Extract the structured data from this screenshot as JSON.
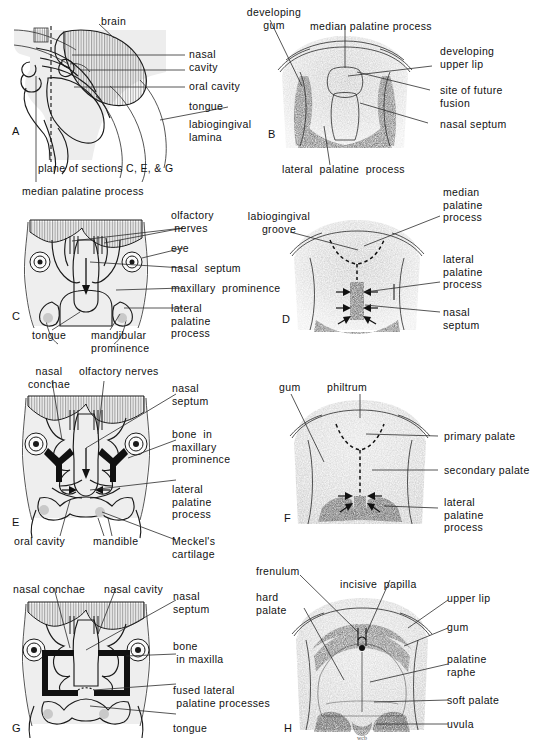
{
  "figure": {
    "panels": [
      {
        "id": "A",
        "id_label": "A",
        "view": "midsagittal section of embryonic head",
        "labels": [
          {
            "name": "brain",
            "text": "brain"
          },
          {
            "name": "nasal-cavity",
            "text": "nasal\ncavity"
          },
          {
            "name": "oral-cavity",
            "text": "oral cavity"
          },
          {
            "name": "tongue",
            "text": "tongue"
          },
          {
            "name": "labiogingival-lamina",
            "text": "labiogingival\nlamina"
          },
          {
            "name": "plane-of-sections",
            "text": "plane of sections C, E, & G"
          }
        ]
      },
      {
        "id": "B",
        "id_label": "B",
        "view": "inferior view of developing palate, earliest stage",
        "labels": [
          {
            "name": "developing-gum",
            "text": "developing\ngum"
          },
          {
            "name": "median-palatine-process",
            "text": "median palatine process"
          },
          {
            "name": "developing-upper-lip",
            "text": "developing\nupper lip"
          },
          {
            "name": "site-of-future-fusion",
            "text": "site of future\nfusion"
          },
          {
            "name": "nasal-septum",
            "text": "nasal septum"
          },
          {
            "name": "lateral-palatine-process",
            "text": "lateral  palatine  process"
          }
        ]
      },
      {
        "id": "C",
        "id_label": "C",
        "view": "coronal section, early stage",
        "labels": [
          {
            "name": "median-palatine-process",
            "text": "median palatine process"
          },
          {
            "name": "olfactory-nerves",
            "text": "olfactory\n nerves"
          },
          {
            "name": "eye",
            "text": "eye"
          },
          {
            "name": "nasal-septum",
            "text": "nasal  septum"
          },
          {
            "name": "maxillary-prominence",
            "text": "maxillary  prominence"
          },
          {
            "name": "lateral-palatine-process",
            "text": "lateral\npalatine\nprocess"
          },
          {
            "name": "tongue",
            "text": "tongue"
          },
          {
            "name": "mandibular-prominence",
            "text": "mandibular\nprominence"
          }
        ]
      },
      {
        "id": "D",
        "id_label": "D",
        "view": "inferior view of palate, fusion beginning",
        "labels": [
          {
            "name": "labiogingival-groove",
            "text": "labiogingival\ngroove"
          },
          {
            "name": "median-palatine-process",
            "text": "median\npalatine\nprocess"
          },
          {
            "name": "lateral-palatine-process",
            "text": "lateral\npalatine\nprocess"
          },
          {
            "name": "nasal-septum",
            "text": "nasal\nseptum"
          }
        ]
      },
      {
        "id": "E",
        "id_label": "E",
        "view": "coronal section, palatine processes elevating",
        "labels": [
          {
            "name": "nasal-conchae",
            "text": "nasal\nconchae"
          },
          {
            "name": "olfactory-nerves",
            "text": "olfactory nerves"
          },
          {
            "name": "nasal-septum",
            "text": "nasal\nseptum"
          },
          {
            "name": "bone-in-maxillary-prominence",
            "text": "bone  in\nmaxillary\nprominence"
          },
          {
            "name": "lateral-palatine-process",
            "text": "lateral\npalatine\nprocess"
          },
          {
            "name": "oral-cavity",
            "text": "oral cavity"
          },
          {
            "name": "mandible",
            "text": "mandible"
          },
          {
            "name": "meckels-cartilage",
            "text": "Meckel's\ncartilage"
          }
        ]
      },
      {
        "id": "F",
        "id_label": "F",
        "view": "inferior view of palate, fusion advancing",
        "labels": [
          {
            "name": "gum",
            "text": "gum"
          },
          {
            "name": "philtrum",
            "text": "philtrum"
          },
          {
            "name": "primary-palate",
            "text": "primary palate"
          },
          {
            "name": "secondary-palate",
            "text": "secondary palate"
          },
          {
            "name": "lateral-palatine-process",
            "text": "lateral\npalatine\nprocess"
          }
        ]
      },
      {
        "id": "G",
        "id_label": "G",
        "view": "coronal section, palate fused",
        "labels": [
          {
            "name": "nasal-conchae",
            "text": "nasal conchae"
          },
          {
            "name": "nasal-cavity",
            "text": "nasal cavity"
          },
          {
            "name": "nasal-septum",
            "text": "nasal\nseptum"
          },
          {
            "name": "bone-in-maxilla",
            "text": "bone\n in maxilla"
          },
          {
            "name": "fused-lateral-palatine-processes",
            "text": "fused lateral\n palatine processes"
          },
          {
            "name": "tongue",
            "text": "tongue"
          }
        ]
      },
      {
        "id": "H",
        "id_label": "H",
        "view": "inferior view of completed palate",
        "labels": [
          {
            "name": "frenulum",
            "text": "frenulum"
          },
          {
            "name": "hard-palate",
            "text": "hard\npalate"
          },
          {
            "name": "incisive-papilla",
            "text": "incisive  papilla"
          },
          {
            "name": "upper-lip",
            "text": "upper lip"
          },
          {
            "name": "gum",
            "text": "gum"
          },
          {
            "name": "palatine-raphe",
            "text": "palatine\nraphe"
          },
          {
            "name": "soft-palate",
            "text": "soft palate"
          },
          {
            "name": "uvula",
            "text": "uvula"
          }
        ]
      }
    ]
  },
  "colors": {
    "ink": "#111111",
    "leader": "#2b2b2b",
    "tissue_fill": "#e9e9e9",
    "bone": "#111111",
    "background": "#ffffff"
  }
}
